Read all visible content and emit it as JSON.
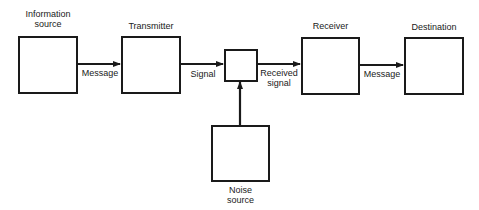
{
  "blocks": {
    "info_source": {
      "line1": "Information",
      "line2": "source"
    },
    "transmitter": {
      "label": "Transmitter"
    },
    "channel": {
      "label": ""
    },
    "receiver": {
      "label": "Receiver"
    },
    "destination": {
      "label": "Destination"
    },
    "noise_source": {
      "line1": "Noise",
      "line2": "source"
    }
  },
  "edges": {
    "message_1": "Message",
    "signal": "Signal",
    "received_1": "Received",
    "received_2": "signal",
    "message_2": "Message"
  },
  "colors": {
    "stroke": "#1a1a1a",
    "background": "#ffffff"
  }
}
